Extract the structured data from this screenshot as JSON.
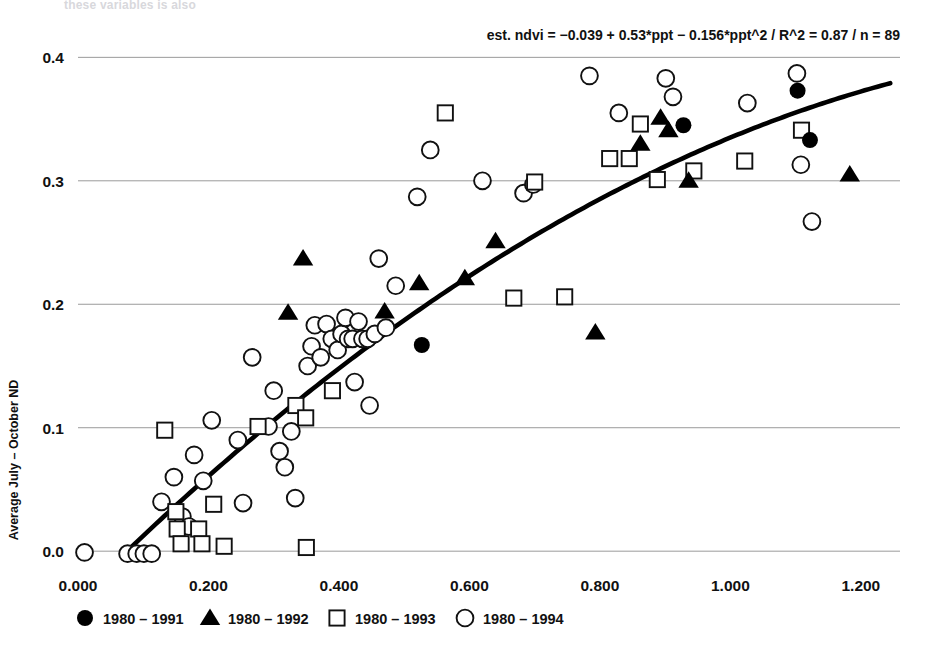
{
  "figure": {
    "top_note": "these variables is also",
    "annotation": "est. ndvi =  −0.039 + 0.53*ppt − 0.156*ppt^2 / R^2 = 0.87 / n = 89",
    "ylabel": "Average July – October ND",
    "xlabel": "",
    "colors": {
      "ink": "#111111",
      "gridline": "#9a9a9a",
      "fit_curve": "#000000",
      "background": "#ffffff"
    }
  },
  "legend": {
    "position": "below-axis",
    "entries": [
      {
        "marker": "filled-circle",
        "label": "1980 – 1991"
      },
      {
        "marker": "filled-triangle",
        "label": "1980 – 1992"
      },
      {
        "marker": "open-square",
        "label": "1980 – 1993"
      },
      {
        "marker": "open-circle",
        "label": "1980 – 1994"
      }
    ]
  },
  "chart_data": {
    "type": "scatter",
    "title": "",
    "xlabel": "",
    "ylabel": "Average July – October ND",
    "xlim": [
      0.0,
      1.26
    ],
    "ylim": [
      -0.012,
      0.41
    ],
    "xticks": [
      0.0,
      0.2,
      0.4,
      0.6,
      0.8,
      1.0,
      1.2
    ],
    "xtick_labels": [
      "0.000",
      "0.200",
      "0.400",
      "0.600",
      "0.800",
      "1.000",
      "1.200"
    ],
    "yticks": [
      0.0,
      0.1,
      0.2,
      0.3,
      0.4
    ],
    "ytick_labels": [
      "0.0",
      "0.1",
      "0.2",
      "0.3",
      "0.4"
    ],
    "grid": "horizontal",
    "legend_position": "below",
    "annotation": "est. ndvi =  −0.039 + 0.53*ppt − 0.156*ppt^2 / R^2 = 0.87 / n = 89",
    "fit": {
      "label": "est. ndvi",
      "type": "quadratic",
      "intercept": -0.039,
      "linear": 0.53,
      "quadratic": -0.156,
      "r_squared": 0.87,
      "n": 89,
      "x_range": [
        0.0735,
        1.245
      ]
    },
    "series": [
      {
        "name": "1980 – 1991",
        "marker": "filled-circle",
        "points": [
          [
            0.527,
            0.167
          ],
          [
            0.928,
            0.345
          ],
          [
            1.103,
            0.373
          ],
          [
            1.122,
            0.333
          ]
        ]
      },
      {
        "name": "1980 – 1992",
        "marker": "filled-triangle",
        "points": [
          [
            0.322,
            0.193
          ],
          [
            0.345,
            0.237
          ],
          [
            0.47,
            0.194
          ],
          [
            0.523,
            0.217
          ],
          [
            0.593,
            0.221
          ],
          [
            0.64,
            0.251
          ],
          [
            0.793,
            0.177
          ],
          [
            0.862,
            0.33
          ],
          [
            0.893,
            0.351
          ],
          [
            0.905,
            0.341
          ],
          [
            0.936,
            0.3
          ],
          [
            1.183,
            0.305
          ]
        ]
      },
      {
        "name": "1980 – 1993",
        "marker": "open-square",
        "points": [
          [
            0.133,
            0.098
          ],
          [
            0.15,
            0.032
          ],
          [
            0.152,
            0.018
          ],
          [
            0.158,
            0.006
          ],
          [
            0.185,
            0.018
          ],
          [
            0.19,
            0.006
          ],
          [
            0.224,
            0.004
          ],
          [
            0.208,
            0.038
          ],
          [
            0.276,
            0.101
          ],
          [
            0.334,
            0.118
          ],
          [
            0.349,
            0.108
          ],
          [
            0.35,
            0.003
          ],
          [
            0.39,
            0.13
          ],
          [
            0.563,
            0.355
          ],
          [
            0.668,
            0.205
          ],
          [
            0.7,
            0.299
          ],
          [
            0.746,
            0.206
          ],
          [
            0.815,
            0.318
          ],
          [
            0.845,
            0.318
          ],
          [
            0.862,
            0.346
          ],
          [
            0.888,
            0.301
          ],
          [
            0.944,
            0.308
          ],
          [
            1.022,
            0.316
          ],
          [
            1.109,
            0.341
          ]
        ]
      },
      {
        "name": "1980 – 1994",
        "marker": "open-circle",
        "points": [
          [
            0.01,
            -0.001
          ],
          [
            0.076,
            -0.002
          ],
          [
            0.09,
            -0.002
          ],
          [
            0.101,
            -0.002
          ],
          [
            0.113,
            -0.002
          ],
          [
            0.128,
            0.04
          ],
          [
            0.147,
            0.06
          ],
          [
            0.16,
            0.028
          ],
          [
            0.17,
            0.02
          ],
          [
            0.178,
            0.078
          ],
          [
            0.192,
            0.057
          ],
          [
            0.205,
            0.106
          ],
          [
            0.245,
            0.09
          ],
          [
            0.253,
            0.039
          ],
          [
            0.267,
            0.157
          ],
          [
            0.292,
            0.101
          ],
          [
            0.3,
            0.13
          ],
          [
            0.309,
            0.081
          ],
          [
            0.317,
            0.068
          ],
          [
            0.327,
            0.097
          ],
          [
            0.333,
            0.043
          ],
          [
            0.352,
            0.15
          ],
          [
            0.358,
            0.166
          ],
          [
            0.363,
            0.183
          ],
          [
            0.372,
            0.157
          ],
          [
            0.381,
            0.184
          ],
          [
            0.389,
            0.172
          ],
          [
            0.398,
            0.163
          ],
          [
            0.404,
            0.176
          ],
          [
            0.41,
            0.189
          ],
          [
            0.414,
            0.172
          ],
          [
            0.421,
            0.172
          ],
          [
            0.424,
            0.137
          ],
          [
            0.43,
            0.186
          ],
          [
            0.436,
            0.172
          ],
          [
            0.444,
            0.172
          ],
          [
            0.447,
            0.118
          ],
          [
            0.455,
            0.176
          ],
          [
            0.461,
            0.237
          ],
          [
            0.472,
            0.181
          ],
          [
            0.487,
            0.215
          ],
          [
            0.52,
            0.287
          ],
          [
            0.54,
            0.325
          ],
          [
            0.62,
            0.3
          ],
          [
            0.683,
            0.29
          ],
          [
            0.698,
            0.297
          ],
          [
            0.784,
            0.385
          ],
          [
            0.829,
            0.355
          ],
          [
            0.901,
            0.383
          ],
          [
            0.912,
            0.368
          ],
          [
            1.026,
            0.363
          ],
          [
            1.102,
            0.387
          ],
          [
            1.108,
            0.313
          ],
          [
            1.125,
            0.267
          ]
        ]
      }
    ]
  }
}
